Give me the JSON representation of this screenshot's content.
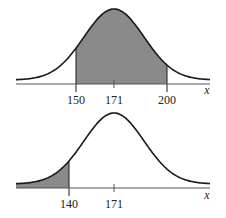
{
  "chart_data": [
    {
      "type": "area",
      "title": "",
      "xlabel": "x",
      "ylabel": "",
      "distribution": "normal",
      "mean": 171,
      "tick_labels": [
        "150",
        "171",
        "200"
      ],
      "ticks": [
        150,
        171,
        200
      ],
      "shaded_region": {
        "from": 150,
        "to": 200
      },
      "grid": false
    },
    {
      "type": "area",
      "title": "",
      "xlabel": "x",
      "ylabel": "",
      "distribution": "normal",
      "mean": 171,
      "tick_labels": [
        "140",
        "171"
      ],
      "ticks": [
        140,
        171
      ],
      "shaded_region": {
        "from": null,
        "to": 140
      },
      "grid": false
    }
  ],
  "top": {
    "labels": [
      "150",
      "171",
      "200"
    ],
    "var": "x"
  },
  "bottom": {
    "labels": [
      "140",
      "171"
    ],
    "var": "x"
  },
  "colors": {
    "shade": "#8a8a8a",
    "curve": "#1a1a1a",
    "axis": "#555555"
  }
}
